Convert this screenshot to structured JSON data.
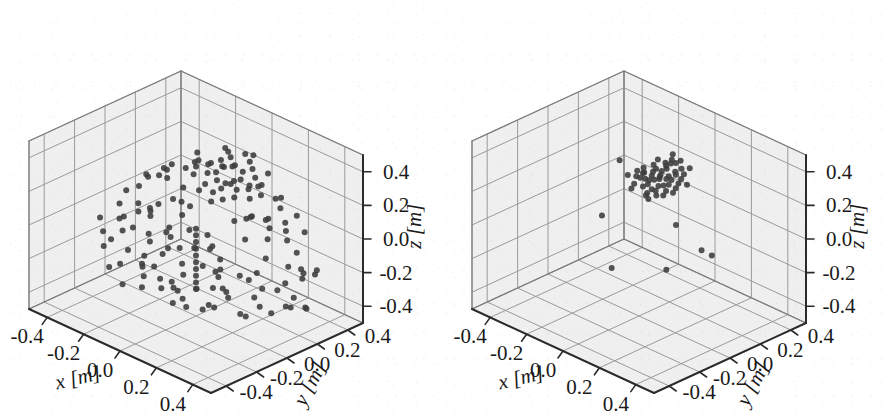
{
  "figure": {
    "panel_count": 2,
    "background_color": "#ffffff",
    "pane_color": "#efefef",
    "grid_color": "#9a9a9a",
    "axis_color": "#2b2b2b",
    "point_color": "#3c3c3c"
  },
  "axes": {
    "x_label": "x [m]",
    "y_label": "y [m]",
    "z_label": "z [m]",
    "x_ticks": [
      "-0.4",
      "-0.2",
      "0.0",
      "0.2",
      "0.4"
    ],
    "y_ticks": [
      "-0.4",
      "-0.2",
      "0.0",
      "0.2",
      "0.4"
    ],
    "z_ticks": [
      "-0.4",
      "-0.2",
      "0.0",
      "0.2",
      "0.4"
    ]
  },
  "chart_data": [
    {
      "type": "scatter",
      "panel": "left",
      "projection": "3d",
      "title": "",
      "xlabel": "x [m]",
      "ylabel": "y [m]",
      "zlabel": "z [m]",
      "xlim": [
        -0.5,
        0.5
      ],
      "ylim": [
        -0.5,
        0.5
      ],
      "zlim": [
        -0.5,
        0.5
      ],
      "xticks": [
        -0.4,
        -0.2,
        0.0,
        0.2,
        0.4
      ],
      "yticks": [
        -0.4,
        -0.2,
        0.0,
        0.2,
        0.4
      ],
      "zticks": [
        -0.4,
        -0.2,
        0.0,
        0.2,
        0.4
      ],
      "grid": true,
      "legend": "none",
      "marker": "o",
      "marker_color": "#3c3c3c",
      "marker_size": 5,
      "n_points": 330,
      "description": "Dense unfiltered point cloud: a compact high cluster near z=0.25 plus a broad ring/band of points spread over the lower half of the volume",
      "points": [
        [
          -0.02,
          0.1,
          0.3
        ],
        [
          0.01,
          0.12,
          0.31
        ],
        [
          0.04,
          0.09,
          0.29
        ],
        [
          -0.05,
          0.14,
          0.32
        ],
        [
          0.07,
          0.11,
          0.28
        ],
        [
          0.02,
          0.16,
          0.33
        ],
        [
          -0.08,
          0.08,
          0.27
        ],
        [
          0.1,
          0.13,
          0.3
        ],
        [
          0.0,
          0.06,
          0.26
        ],
        [
          0.05,
          0.18,
          0.34
        ],
        [
          -0.03,
          0.2,
          0.33
        ],
        [
          0.08,
          0.07,
          0.27
        ],
        [
          0.12,
          0.15,
          0.31
        ],
        [
          -0.1,
          0.12,
          0.29
        ],
        [
          0.03,
          0.22,
          0.32
        ],
        [
          0.06,
          0.04,
          0.25
        ],
        [
          -0.06,
          0.17,
          0.31
        ],
        [
          0.14,
          0.1,
          0.28
        ],
        [
          -0.01,
          0.24,
          0.34
        ],
        [
          0.09,
          0.2,
          0.32
        ],
        [
          0.16,
          0.06,
          0.26
        ],
        [
          -0.12,
          0.16,
          0.3
        ],
        [
          0.11,
          0.24,
          0.33
        ],
        [
          0.0,
          0.02,
          0.24
        ],
        [
          0.18,
          0.13,
          0.29
        ],
        [
          -0.04,
          0.26,
          0.35
        ],
        [
          0.13,
          0.02,
          0.25
        ],
        [
          0.07,
          0.27,
          0.34
        ],
        [
          -0.14,
          0.1,
          0.27
        ],
        [
          0.2,
          0.17,
          0.3
        ],
        [
          0.02,
          0.3,
          0.35
        ],
        [
          0.15,
          0.21,
          0.31
        ],
        [
          -0.07,
          0.0,
          0.23
        ],
        [
          0.22,
          0.09,
          0.27
        ],
        [
          0.04,
          0.33,
          0.34
        ],
        [
          -0.16,
          0.2,
          0.31
        ],
        [
          0.17,
          0.27,
          0.32
        ],
        [
          0.1,
          -0.02,
          0.24
        ],
        [
          0.24,
          0.14,
          0.28
        ],
        [
          -0.09,
          0.3,
          0.33
        ],
        [
          -0.2,
          0.05,
          0.2
        ],
        [
          -0.26,
          0.12,
          0.19
        ],
        [
          0.26,
          0.02,
          0.2
        ],
        [
          0.3,
          0.1,
          0.18
        ],
        [
          -0.3,
          0.2,
          0.17
        ],
        [
          0.28,
          0.22,
          0.19
        ],
        [
          -0.24,
          0.28,
          0.18
        ],
        [
          0.2,
          0.32,
          0.17
        ],
        [
          -0.14,
          0.34,
          0.18
        ],
        [
          0.06,
          0.36,
          0.16
        ],
        [
          0.34,
          0.18,
          0.15
        ],
        [
          -0.34,
          0.08,
          0.14
        ],
        [
          0.32,
          -0.06,
          0.14
        ],
        [
          -0.28,
          -0.04,
          0.15
        ],
        [
          0.18,
          -0.14,
          0.13
        ],
        [
          -0.1,
          -0.18,
          0.12
        ],
        [
          0.02,
          -0.2,
          0.12
        ],
        [
          -0.2,
          -0.14,
          0.13
        ],
        [
          0.24,
          -0.18,
          0.11
        ],
        [
          0.36,
          0.04,
          0.12
        ],
        [
          -0.36,
          0.22,
          0.11
        ],
        [
          0.12,
          0.38,
          0.1
        ],
        [
          -0.04,
          0.4,
          0.09
        ],
        [
          0.38,
          0.26,
          0.08
        ],
        [
          -0.38,
          0.14,
          0.08
        ],
        [
          0.3,
          -0.2,
          0.07
        ],
        [
          -0.22,
          -0.24,
          0.07
        ],
        [
          0.08,
          -0.28,
          0.06
        ],
        [
          -0.32,
          -0.12,
          0.06
        ],
        [
          0.4,
          -0.02,
          0.05
        ],
        [
          -0.4,
          0.02,
          0.04
        ],
        [
          0.22,
          0.4,
          0.04
        ],
        [
          -0.16,
          0.42,
          0.03
        ],
        [
          0.42,
          0.16,
          0.02
        ],
        [
          -0.42,
          0.26,
          0.02
        ],
        [
          0.34,
          -0.26,
          0.01
        ],
        [
          -0.26,
          -0.3,
          0.0
        ],
        [
          0.0,
          -0.34,
          0.0
        ],
        [
          -0.36,
          -0.2,
          -0.01
        ],
        [
          0.44,
          0.08,
          -0.02
        ],
        [
          -0.3,
          0.06,
          -0.05
        ],
        [
          -0.34,
          0.16,
          -0.07
        ],
        [
          -0.38,
          -0.02,
          -0.09
        ],
        [
          -0.28,
          0.24,
          -0.06
        ],
        [
          -0.4,
          0.1,
          -0.12
        ],
        [
          -0.32,
          -0.1,
          -0.11
        ],
        [
          -0.36,
          0.28,
          -0.1
        ],
        [
          -0.26,
          0.0,
          -0.14
        ],
        [
          -0.42,
          0.2,
          -0.15
        ],
        [
          -0.3,
          0.32,
          -0.13
        ],
        [
          -0.24,
          -0.16,
          -0.16
        ],
        [
          -0.38,
          0.04,
          -0.18
        ],
        [
          -0.34,
          -0.2,
          -0.17
        ],
        [
          -0.28,
          0.14,
          -0.2
        ],
        [
          -0.4,
          -0.08,
          -0.21
        ],
        [
          -0.22,
          0.22,
          -0.19
        ],
        [
          -0.36,
          0.34,
          -0.22
        ],
        [
          -0.26,
          -0.26,
          -0.23
        ],
        [
          -0.32,
          0.08,
          -0.25
        ],
        [
          -0.2,
          0.02,
          -0.24
        ],
        [
          -0.18,
          -0.06,
          -0.27
        ],
        [
          -0.3,
          -0.14,
          -0.28
        ],
        [
          -0.24,
          0.18,
          -0.29
        ],
        [
          -0.34,
          0.24,
          -0.3
        ],
        [
          -0.16,
          0.1,
          -0.31
        ],
        [
          -0.28,
          -0.02,
          -0.32
        ],
        [
          -0.22,
          -0.22,
          -0.33
        ],
        [
          -0.12,
          0.06,
          -0.34
        ],
        [
          -0.26,
          0.3,
          -0.35
        ],
        [
          -0.18,
          -0.14,
          -0.36
        ],
        [
          -0.08,
          0.14,
          -0.3
        ],
        [
          -0.14,
          0.26,
          -0.28
        ],
        [
          -0.1,
          -0.04,
          -0.33
        ],
        [
          -0.06,
          0.2,
          -0.35
        ],
        [
          -0.04,
          -0.1,
          -0.31
        ],
        [
          0.0,
          0.16,
          -0.29
        ],
        [
          0.02,
          -0.02,
          -0.32
        ],
        [
          0.04,
          0.24,
          -0.34
        ],
        [
          0.06,
          -0.16,
          -0.3
        ],
        [
          0.08,
          0.08,
          -0.33
        ],
        [
          0.1,
          0.28,
          -0.31
        ],
        [
          0.12,
          -0.06,
          -0.35
        ],
        [
          0.14,
          0.18,
          -0.29
        ],
        [
          0.16,
          0.02,
          -0.32
        ],
        [
          0.18,
          0.22,
          -0.34
        ],
        [
          0.2,
          -0.12,
          -0.3
        ],
        [
          0.22,
          0.12,
          -0.33
        ],
        [
          0.24,
          0.3,
          -0.31
        ],
        [
          0.26,
          -0.02,
          -0.35
        ],
        [
          0.28,
          0.2,
          -0.29
        ],
        [
          0.3,
          0.06,
          -0.32
        ],
        [
          0.32,
          0.26,
          -0.34
        ],
        [
          0.34,
          -0.08,
          -0.3
        ],
        [
          0.36,
          0.16,
          -0.33
        ],
        [
          0.38,
          0.04,
          -0.31
        ],
        [
          0.4,
          0.24,
          -0.35
        ],
        [
          0.42,
          0.12,
          -0.29
        ],
        [
          0.44,
          0.2,
          -0.32
        ],
        [
          0.3,
          0.34,
          -0.27
        ],
        [
          0.26,
          0.38,
          -0.25
        ],
        [
          0.22,
          -0.22,
          -0.26
        ],
        [
          0.18,
          -0.28,
          -0.24
        ],
        [
          0.14,
          -0.32,
          -0.22
        ],
        [
          0.1,
          -0.24,
          -0.2
        ],
        [
          0.06,
          -0.3,
          -0.18
        ],
        [
          0.02,
          -0.26,
          -0.16
        ],
        [
          -0.02,
          -0.32,
          -0.14
        ],
        [
          -0.06,
          -0.28,
          -0.12
        ],
        [
          0.34,
          0.3,
          -0.2
        ],
        [
          0.38,
          0.34,
          -0.18
        ],
        [
          0.42,
          0.28,
          -0.16
        ],
        [
          0.3,
          -0.16,
          -0.14
        ],
        [
          0.26,
          -0.2,
          -0.12
        ],
        [
          0.2,
          0.36,
          -0.1
        ],
        [
          0.16,
          0.4,
          -0.08
        ],
        [
          0.12,
          0.34,
          -0.06
        ],
        [
          0.08,
          0.38,
          -0.04
        ],
        [
          0.04,
          0.32,
          -0.02
        ],
        [
          0.0,
          0.36,
          -0.06
        ],
        [
          -0.04,
          0.3,
          -0.08
        ],
        [
          0.0,
          0.0,
          -0.1
        ],
        [
          0.0,
          0.0,
          -0.14
        ],
        [
          0.0,
          0.0,
          -0.18
        ],
        [
          0.0,
          0.0,
          -0.22
        ],
        [
          0.0,
          0.0,
          -0.26
        ],
        [
          0.0,
          0.0,
          -0.3
        ],
        [
          0.0,
          0.0,
          -0.34
        ],
        [
          0.0,
          0.0,
          -0.06
        ],
        [
          0.0,
          0.0,
          -0.02
        ],
        [
          0.0,
          0.0,
          0.02
        ]
      ]
    },
    {
      "type": "scatter",
      "panel": "right",
      "projection": "3d",
      "title": "",
      "xlabel": "x [m]",
      "ylabel": "y [m]",
      "zlabel": "z [m]",
      "xlim": [
        -0.5,
        0.5
      ],
      "ylim": [
        -0.5,
        0.5
      ],
      "zlim": [
        -0.5,
        0.5
      ],
      "xticks": [
        -0.4,
        -0.2,
        0.0,
        0.2,
        0.4
      ],
      "yticks": [
        -0.4,
        -0.2,
        0.0,
        0.2,
        0.4
      ],
      "zticks": [
        -0.4,
        -0.2,
        0.0,
        0.2,
        0.4
      ],
      "grid": true,
      "legend": "none",
      "marker": "o",
      "marker_color": "#3c3c3c",
      "marker_size": 5,
      "n_points": 62,
      "description": "Filtered result: one tight cluster of about 55 points near the top of the volume plus 6 sparse outlier points",
      "points": [
        [
          0.0,
          0.1,
          0.27
        ],
        [
          0.02,
          0.11,
          0.28
        ],
        [
          -0.02,
          0.09,
          0.26
        ],
        [
          0.01,
          0.13,
          0.29
        ],
        [
          -0.01,
          0.07,
          0.25
        ],
        [
          0.03,
          0.1,
          0.3
        ],
        [
          -0.03,
          0.12,
          0.27
        ],
        [
          0.04,
          0.08,
          0.26
        ],
        [
          -0.04,
          0.14,
          0.28
        ],
        [
          0.02,
          0.06,
          0.24
        ],
        [
          0.05,
          0.12,
          0.29
        ],
        [
          -0.05,
          0.1,
          0.25
        ],
        [
          0.0,
          0.15,
          0.3
        ],
        [
          0.06,
          0.09,
          0.27
        ],
        [
          -0.06,
          0.08,
          0.26
        ],
        [
          0.03,
          0.16,
          0.28
        ],
        [
          -0.02,
          0.05,
          0.24
        ],
        [
          0.07,
          0.13,
          0.29
        ],
        [
          -0.07,
          0.11,
          0.27
        ],
        [
          0.01,
          0.17,
          0.31
        ],
        [
          0.05,
          0.05,
          0.25
        ],
        [
          -0.04,
          0.16,
          0.29
        ],
        [
          0.08,
          0.1,
          0.28
        ],
        [
          -0.08,
          0.13,
          0.26
        ],
        [
          0.02,
          0.03,
          0.23
        ],
        [
          0.06,
          0.17,
          0.3
        ],
        [
          -0.06,
          0.04,
          0.24
        ],
        [
          0.09,
          0.07,
          0.26
        ],
        [
          -0.01,
          0.19,
          0.31
        ],
        [
          0.04,
          0.19,
          0.3
        ],
        [
          -0.09,
          0.09,
          0.25
        ],
        [
          0.07,
          0.03,
          0.24
        ],
        [
          0.0,
          0.21,
          0.32
        ],
        [
          -0.03,
          0.21,
          0.31
        ],
        [
          0.1,
          0.14,
          0.28
        ],
        [
          -0.1,
          0.15,
          0.27
        ],
        [
          0.08,
          0.2,
          0.3
        ],
        [
          0.03,
          0.01,
          0.23
        ],
        [
          -0.07,
          0.18,
          0.29
        ],
        [
          0.11,
          0.11,
          0.27
        ],
        [
          -0.05,
          0.01,
          0.23
        ],
        [
          0.09,
          0.17,
          0.29
        ],
        [
          0.01,
          0.23,
          0.32
        ],
        [
          -0.11,
          0.12,
          0.26
        ],
        [
          0.05,
          0.22,
          0.31
        ],
        [
          0.12,
          0.08,
          0.26
        ],
        [
          -0.08,
          0.22,
          0.3
        ],
        [
          0.06,
          -0.01,
          0.23
        ],
        [
          0.02,
          0.25,
          0.33
        ],
        [
          -0.02,
          0.24,
          0.32
        ],
        [
          0.1,
          0.04,
          0.25
        ],
        [
          -0.12,
          0.07,
          0.25
        ],
        [
          0.13,
          0.16,
          0.28
        ],
        [
          -0.04,
          0.27,
          0.33
        ],
        [
          0.07,
          0.25,
          0.31
        ],
        [
          -0.24,
          0.16,
          0.24
        ],
        [
          0.22,
          -0.02,
          0.16
        ],
        [
          -0.12,
          -0.1,
          0.08
        ],
        [
          0.3,
          0.12,
          -0.04
        ],
        [
          0.1,
          0.06,
          -0.2
        ],
        [
          -0.1,
          -0.06,
          -0.24
        ],
        [
          0.16,
          0.22,
          -0.12
        ]
      ]
    }
  ]
}
